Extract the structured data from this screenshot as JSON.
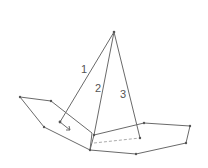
{
  "diagram": {
    "type": "line drawing",
    "labels": [
      {
        "id": "1",
        "text": "1"
      },
      {
        "id": "2",
        "text": "2"
      },
      {
        "id": "3",
        "text": "3"
      }
    ],
    "apex": [
      114,
      32
    ],
    "line_color": "#6a6a6a"
  }
}
